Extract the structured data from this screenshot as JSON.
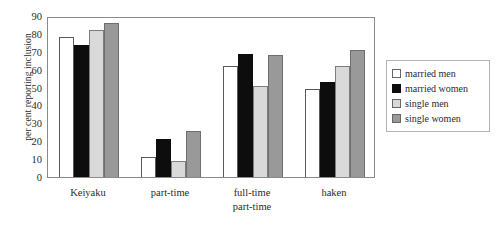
{
  "chart_data": {
    "type": "bar",
    "title": "",
    "xlabel": "",
    "ylabel": "per cent reporting inclusion",
    "ylim": [
      0,
      90
    ],
    "ytick_step": 10,
    "yticks": [
      90,
      80,
      70,
      60,
      50,
      40,
      30,
      20,
      10,
      0
    ],
    "grid": false,
    "legend_position": "right",
    "categories": [
      "Keiyaku",
      "part-time",
      "full-time part-time",
      "haken"
    ],
    "category_lines": [
      [
        "Keiyaku"
      ],
      [
        "part-time"
      ],
      [
        "full-time",
        "part-time"
      ],
      [
        "haken"
      ]
    ],
    "series": [
      {
        "name": "married men",
        "color": "#ffffff",
        "values": [
          78,
          11,
          62,
          49
        ]
      },
      {
        "name": "married women",
        "color": "#0d0d0d",
        "values": [
          74,
          21,
          69,
          53
        ]
      },
      {
        "name": "single men",
        "color": "#d9d9d9",
        "values": [
          82,
          9,
          51,
          62
        ]
      },
      {
        "name": "single women",
        "color": "#999999",
        "values": [
          86,
          26,
          68,
          71
        ]
      }
    ]
  },
  "legend": {
    "entries": [
      {
        "label": "married men"
      },
      {
        "label": "married women"
      },
      {
        "label": "single men"
      },
      {
        "label": "single women"
      }
    ]
  }
}
